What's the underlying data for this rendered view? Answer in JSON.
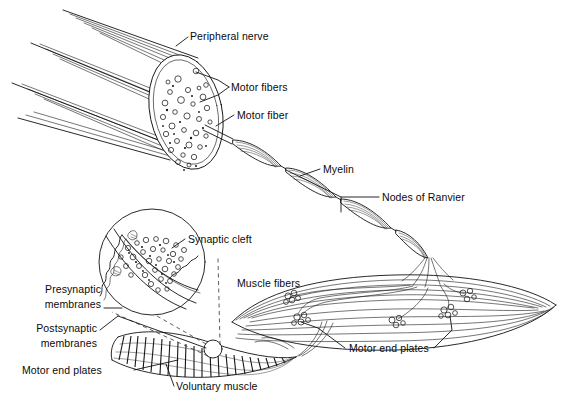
{
  "figure": {
    "background_color": "#ffffff",
    "ink_color": "#111111",
    "width": 566,
    "height": 408
  },
  "labels": {
    "peripheral_nerve": "Peripheral nerve",
    "motor_fibers": "Motor fibers",
    "motor_fiber": "Motor fiber",
    "myelin": "Myelin",
    "nodes_of_ranvier": "Nodes of Ranvier",
    "muscle_fibers": "Muscle fibers",
    "motor_end_plates_right": "Motor end plates",
    "synaptic_cleft": "Synaptic cleft",
    "presynaptic_line1": "Presynaptic",
    "presynaptic_line2": "membranes",
    "postsynaptic_line1": "Postsynaptic",
    "postsynaptic_line2": "membranes",
    "motor_end_plates_left": "Motor end plates",
    "voluntary_muscle": "Voluntary muscle"
  },
  "structures": {
    "nerve_bundle": "peripheral-nerve-trunk",
    "nerve_cross_section": "nerve-cross-section-with-fascicles",
    "myelinated_axon": "myelinated-motor-axon-segments",
    "muscle_belly": "muscle-fiber-belly",
    "end_plate_clusters": "motor-end-plate-clusters",
    "synapse_inset": "magnified-synapse-circle",
    "striated_muscle": "striated-voluntary-muscle-bundle",
    "magnifier_marker": "small-circle-on-muscle"
  }
}
